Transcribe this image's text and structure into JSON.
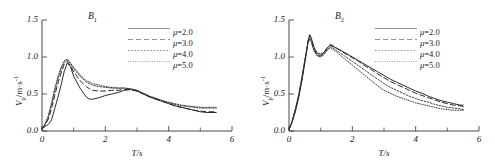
{
  "figure": {
    "panels": [
      {
        "tag": "B",
        "tag_sub": "1",
        "axis": {
          "xlabel": "T/s",
          "ylabel_main": "V",
          "ylabel_sub": "p",
          "ylabel_rest": "/m·s",
          "ylabel_sup": "-1",
          "xticks": [
            "0",
            "2",
            "4",
            "6"
          ],
          "xtick_values": [
            0,
            2,
            4,
            6
          ],
          "yticks": [
            "0.0",
            "0.5",
            "1.0",
            "1.5"
          ],
          "ytick_values": [
            0.0,
            0.5,
            1.0,
            1.5
          ],
          "xlim": [
            0,
            6
          ],
          "ylim": [
            0,
            1.5
          ],
          "xminor": [
            1,
            3,
            5
          ],
          "grid": false
        },
        "legend": {
          "position": "top-right",
          "entries": [
            {
              "label": "μ=2.0",
              "style": "solid"
            },
            {
              "label": "μ=3.0",
              "style": "dashed"
            },
            {
              "label": "μ=4.0",
              "style": "dotted"
            },
            {
              "label": "μ=5.0",
              "style": "fine-dotted"
            }
          ]
        }
      },
      {
        "tag": "B",
        "tag_sub": "2",
        "axis": {
          "xlabel": "T/s",
          "ylabel_main": "V",
          "ylabel_sub": "p",
          "ylabel_rest": "/m·s",
          "ylabel_sup": "-1",
          "xticks": [
            "0",
            "2",
            "4",
            "6"
          ],
          "xtick_values": [
            0,
            2,
            4,
            6
          ],
          "yticks": [
            "0.0",
            "0.5",
            "1.0",
            "1.5"
          ],
          "ytick_values": [
            0.0,
            0.5,
            1.0,
            1.5
          ],
          "xlim": [
            0,
            6
          ],
          "ylim": [
            0,
            1.5
          ],
          "xminor": [
            1,
            3,
            5
          ],
          "grid": false
        },
        "legend": {
          "position": "top-right",
          "entries": [
            {
              "label": "μ=2.0",
              "style": "solid"
            },
            {
              "label": "μ=3.0",
              "style": "dashed"
            },
            {
              "label": "μ=4.0",
              "style": "dotted"
            },
            {
              "label": "μ=5.0",
              "style": "fine-dotted"
            }
          ]
        }
      }
    ]
  },
  "chart_data": [
    {
      "type": "line",
      "title": "B1",
      "xlabel": "T/s",
      "ylabel": "Vp/m·s-1",
      "xlim": [
        0,
        6
      ],
      "ylim": [
        0,
        1.5
      ],
      "grid": false,
      "legend_position": "top-right",
      "x": [
        0,
        0.1,
        0.2,
        0.3,
        0.4,
        0.5,
        0.6,
        0.7,
        0.8,
        0.9,
        1.0,
        1.2,
        1.4,
        1.5,
        1.6,
        1.8,
        2.0,
        2.2,
        2.4,
        2.6,
        2.8,
        3.0,
        3.2,
        3.4,
        3.6,
        3.8,
        4.0,
        4.2,
        4.4,
        4.6,
        4.8,
        5.0,
        5.2,
        5.4,
        5.5
      ],
      "series": [
        {
          "name": "μ=2.0",
          "style": "solid",
          "values": [
            0.03,
            0.06,
            0.09,
            0.15,
            0.3,
            0.45,
            0.62,
            0.8,
            0.92,
            0.87,
            0.74,
            0.58,
            0.46,
            0.43,
            0.43,
            0.45,
            0.48,
            0.5,
            0.52,
            0.55,
            0.56,
            0.54,
            0.5,
            0.46,
            0.43,
            0.4,
            0.37,
            0.34,
            0.32,
            0.3,
            0.28,
            0.26,
            0.25,
            0.25,
            0.25
          ]
        },
        {
          "name": "μ=3.0",
          "style": "dashed",
          "values": [
            0.03,
            0.08,
            0.16,
            0.3,
            0.48,
            0.64,
            0.78,
            0.9,
            0.94,
            0.88,
            0.8,
            0.68,
            0.6,
            0.57,
            0.55,
            0.54,
            0.54,
            0.55,
            0.55,
            0.56,
            0.56,
            0.54,
            0.5,
            0.46,
            0.43,
            0.4,
            0.37,
            0.34,
            0.32,
            0.3,
            0.28,
            0.27,
            0.26,
            0.26,
            0.26
          ]
        },
        {
          "name": "μ=4.0",
          "style": "dotted",
          "values": [
            0.03,
            0.09,
            0.19,
            0.35,
            0.54,
            0.7,
            0.83,
            0.93,
            0.96,
            0.91,
            0.84,
            0.74,
            0.66,
            0.64,
            0.62,
            0.6,
            0.59,
            0.58,
            0.58,
            0.58,
            0.57,
            0.55,
            0.51,
            0.47,
            0.44,
            0.41,
            0.38,
            0.36,
            0.34,
            0.33,
            0.32,
            0.31,
            0.31,
            0.31,
            0.31
          ]
        },
        {
          "name": "μ=5.0",
          "style": "fine-dotted",
          "values": [
            0.03,
            0.1,
            0.21,
            0.38,
            0.57,
            0.73,
            0.86,
            0.95,
            0.97,
            0.92,
            0.86,
            0.76,
            0.68,
            0.66,
            0.64,
            0.62,
            0.6,
            0.59,
            0.58,
            0.58,
            0.57,
            0.55,
            0.51,
            0.47,
            0.44,
            0.41,
            0.39,
            0.37,
            0.35,
            0.34,
            0.33,
            0.32,
            0.32,
            0.32,
            0.32
          ]
        }
      ]
    },
    {
      "type": "line",
      "title": "B2",
      "xlabel": "T/s",
      "ylabel": "Vp/m·s-1",
      "xlim": [
        0,
        6
      ],
      "ylim": [
        0,
        1.5
      ],
      "grid": false,
      "legend_position": "top-right",
      "x": [
        0,
        0.1,
        0.2,
        0.3,
        0.4,
        0.5,
        0.6,
        0.65,
        0.7,
        0.8,
        0.9,
        1.0,
        1.1,
        1.2,
        1.3,
        1.4,
        1.5,
        1.6,
        1.8,
        2.0,
        2.2,
        2.4,
        2.6,
        2.8,
        3.0,
        3.2,
        3.4,
        3.6,
        3.8,
        4.0,
        4.2,
        4.4,
        4.6,
        4.8,
        5.0,
        5.2,
        5.4,
        5.5
      ],
      "series": [
        {
          "name": "μ=2.0",
          "style": "solid",
          "values": [
            0.02,
            0.12,
            0.26,
            0.44,
            0.66,
            0.92,
            1.2,
            1.3,
            1.26,
            1.12,
            1.05,
            1.04,
            1.06,
            1.12,
            1.16,
            1.14,
            1.12,
            1.1,
            1.05,
            1.0,
            0.95,
            0.9,
            0.85,
            0.8,
            0.75,
            0.7,
            0.66,
            0.62,
            0.58,
            0.54,
            0.51,
            0.47,
            0.44,
            0.41,
            0.39,
            0.37,
            0.35,
            0.35
          ]
        },
        {
          "name": "μ=3.0",
          "style": "dashed",
          "values": [
            0.02,
            0.13,
            0.28,
            0.46,
            0.68,
            0.94,
            1.22,
            1.3,
            1.25,
            1.1,
            1.03,
            1.02,
            1.05,
            1.12,
            1.17,
            1.15,
            1.12,
            1.09,
            1.04,
            0.99,
            0.94,
            0.88,
            0.83,
            0.77,
            0.72,
            0.67,
            0.63,
            0.59,
            0.55,
            0.51,
            0.48,
            0.45,
            0.42,
            0.39,
            0.37,
            0.35,
            0.34,
            0.33
          ]
        },
        {
          "name": "μ=4.0",
          "style": "dotted",
          "values": [
            0.02,
            0.13,
            0.29,
            0.47,
            0.7,
            0.95,
            1.2,
            1.26,
            1.22,
            1.08,
            1.02,
            1.01,
            1.04,
            1.1,
            1.14,
            1.12,
            1.09,
            1.06,
            1.0,
            0.94,
            0.88,
            0.82,
            0.76,
            0.7,
            0.64,
            0.59,
            0.55,
            0.51,
            0.47,
            0.44,
            0.41,
            0.39,
            0.36,
            0.34,
            0.32,
            0.31,
            0.3,
            0.29
          ]
        },
        {
          "name": "μ=5.0",
          "style": "fine-dotted",
          "values": [
            0.02,
            0.14,
            0.3,
            0.48,
            0.71,
            0.96,
            1.19,
            1.24,
            1.2,
            1.07,
            1.01,
            1.0,
            1.03,
            1.09,
            1.12,
            1.1,
            1.07,
            1.03,
            0.96,
            0.89,
            0.82,
            0.75,
            0.68,
            0.61,
            0.55,
            0.51,
            0.47,
            0.44,
            0.41,
            0.38,
            0.36,
            0.34,
            0.32,
            0.3,
            0.29,
            0.28,
            0.28,
            0.28
          ]
        }
      ]
    }
  ]
}
